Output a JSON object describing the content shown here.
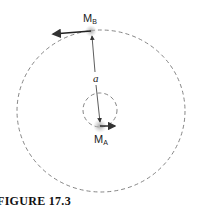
{
  "diagram": {
    "labels": {
      "mass_b": "M",
      "mass_b_sub": "B",
      "mass_a": "M",
      "mass_a_sub": "A",
      "separation": "a"
    },
    "caption": "FIGURE 17.3",
    "orbits": [
      {
        "name": "outer-orbit",
        "cx": 101,
        "cy": 111,
        "rx": 84,
        "ry": 81,
        "style": "dashed"
      },
      {
        "name": "inner-orbit",
        "cx": 100,
        "cy": 110,
        "r": 17,
        "style": "dashed"
      }
    ],
    "colors": {
      "line": "#333333",
      "dash": "#777777",
      "glow": "#bbbbbb"
    }
  }
}
